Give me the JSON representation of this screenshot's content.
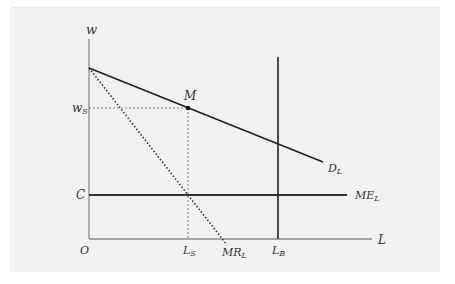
{
  "diagram": {
    "type": "monopsony-labor-market",
    "axes": {
      "y_label": "w",
      "x_label": "L",
      "origin_label": "O"
    },
    "curves": {
      "demand": {
        "main": "D",
        "sub": "L"
      },
      "marginal_revenue": {
        "main": "MR",
        "sub": "L"
      },
      "marginal_expense": {
        "main": "ME",
        "sub": "L"
      }
    },
    "points": {
      "M": "M"
    },
    "y_ticks": {
      "ws": {
        "main": "w",
        "sub": "S"
      },
      "c": "C"
    },
    "x_ticks": {
      "ls": {
        "main": "L",
        "sub": "S"
      },
      "lb": {
        "main": "L",
        "sub": "B"
      }
    },
    "colors": {
      "background": "#f1f1f1",
      "axis": "#888888",
      "line": "#222222",
      "guide": "#777777"
    }
  }
}
